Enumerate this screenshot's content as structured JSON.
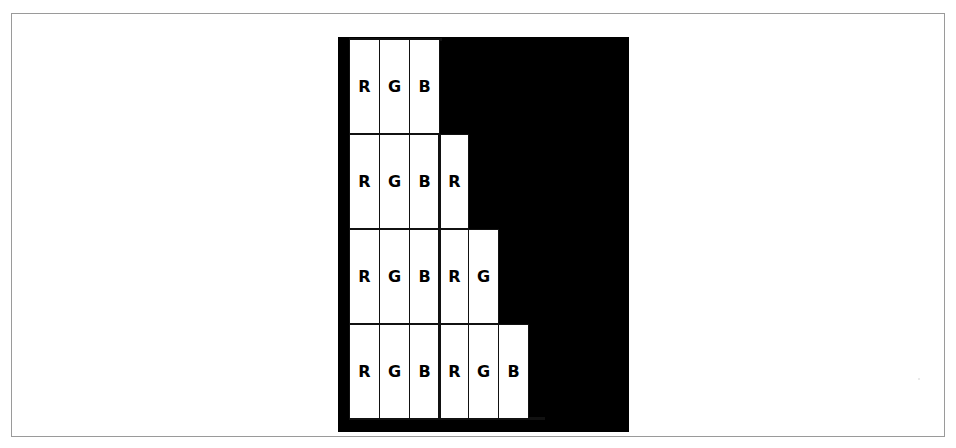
{
  "figure": {
    "caption": "",
    "background_color": "#ffffff",
    "frame_color": "#9a9a9a",
    "fill_color": "#000000",
    "cell_color": "#ffffff",
    "line_color": "#111111"
  },
  "chart_data": {
    "type": "table",
    "title": "",
    "subtitle": "",
    "xlabel": "",
    "ylabel": "",
    "columns": 6,
    "rows": 4,
    "group_divider_after_column": 3,
    "categories": [
      "row 1",
      "row 2",
      "row 3",
      "row 4"
    ],
    "values": [
      3,
      4,
      5,
      6
    ],
    "grid": true,
    "legend": "none",
    "rows_data": [
      {
        "index": 0,
        "labels": [
          "R",
          "G",
          "B"
        ],
        "white_cell_count": 3,
        "black_cell_count": 3
      },
      {
        "index": 1,
        "labels": [
          "R",
          "G",
          "B",
          "R"
        ],
        "white_cell_count": 4,
        "black_cell_count": 2
      },
      {
        "index": 2,
        "labels": [
          "R",
          "G",
          "B",
          "R",
          "G"
        ],
        "white_cell_count": 5,
        "black_cell_count": 1
      },
      {
        "index": 3,
        "labels": [
          "R",
          "G",
          "B",
          "R",
          "G",
          "B"
        ],
        "white_cell_count": 6,
        "black_cell_count": 0
      }
    ]
  }
}
